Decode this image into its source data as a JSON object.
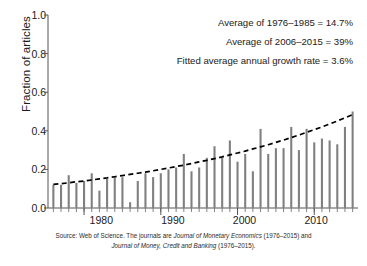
{
  "chart_data": {
    "type": "bar",
    "title": "",
    "xlabel": "",
    "ylabel": "Fraction of articles",
    "ylim": [
      0.0,
      1.0
    ],
    "xlim": [
      1975.3,
      2015.7
    ],
    "yticks": [
      "0.0",
      "0.2",
      "0.4",
      "0.6",
      "0.8",
      "1.0"
    ],
    "ytick_values": [
      0.0,
      0.2,
      0.4,
      0.6,
      0.8,
      1.0
    ],
    "xticks": [
      "1980",
      "1990",
      "2000",
      "2010"
    ],
    "xtick_values": [
      1980,
      1990,
      2000,
      2010
    ],
    "minor_xticks": "every year 1976-2015",
    "grid": false,
    "legend": "none",
    "bar_color": "#808080",
    "trend_color": "#000000",
    "trend_style": "dashed",
    "categories": [
      1976,
      1977,
      1978,
      1979,
      1980,
      1981,
      1982,
      1983,
      1984,
      1985,
      1986,
      1987,
      1988,
      1989,
      1990,
      1991,
      1992,
      1993,
      1994,
      1995,
      1996,
      1997,
      1998,
      1999,
      2000,
      2001,
      2002,
      2003,
      2004,
      2005,
      2006,
      2007,
      2008,
      2009,
      2010,
      2011,
      2012,
      2013,
      2014,
      2015
    ],
    "values": [
      0.12,
      0.12,
      0.17,
      0.13,
      0.14,
      0.18,
      0.09,
      0.15,
      0.16,
      0.16,
      0.03,
      0.14,
      0.18,
      0.16,
      0.18,
      0.2,
      0.21,
      0.28,
      0.19,
      0.21,
      0.26,
      0.32,
      0.26,
      0.35,
      0.24,
      0.28,
      0.19,
      0.41,
      0.28,
      0.31,
      0.31,
      0.42,
      0.3,
      0.41,
      0.34,
      0.36,
      0.35,
      0.33,
      0.42,
      0.5
    ],
    "series": [
      {
        "name": "Fraction of articles",
        "type": "bar",
        "values": [
          0.12,
          0.12,
          0.17,
          0.13,
          0.14,
          0.18,
          0.09,
          0.15,
          0.16,
          0.16,
          0.03,
          0.14,
          0.18,
          0.16,
          0.18,
          0.2,
          0.21,
          0.28,
          0.19,
          0.21,
          0.26,
          0.32,
          0.26,
          0.35,
          0.24,
          0.28,
          0.19,
          0.41,
          0.28,
          0.31,
          0.31,
          0.42,
          0.3,
          0.41,
          0.34,
          0.36,
          0.35,
          0.33,
          0.42,
          0.5
        ]
      },
      {
        "name": "Fitted trend",
        "type": "line",
        "values": [
          0.122,
          0.126,
          0.131,
          0.136,
          0.14,
          0.145,
          0.151,
          0.156,
          0.162,
          0.168,
          0.174,
          0.18,
          0.186,
          0.193,
          0.2,
          0.207,
          0.215,
          0.222,
          0.23,
          0.239,
          0.247,
          0.256,
          0.265,
          0.275,
          0.285,
          0.295,
          0.306,
          0.317,
          0.328,
          0.34,
          0.352,
          0.365,
          0.378,
          0.392,
          0.406,
          0.42,
          0.435,
          0.451,
          0.467,
          0.484
        ]
      }
    ],
    "annotations": [
      "Average of 1976–1985 = 14.7%",
      "Average of 2006–2015 = 39%",
      "Fitted average annual growth rate = 3.6%"
    ]
  },
  "axis": {
    "ylabel": "Fraction of articles",
    "yticks": [
      "1.0",
      "0.8",
      "0.6",
      "0.4",
      "0.2",
      "0.0"
    ],
    "xticks": [
      "1980",
      "1990",
      "2000",
      "2010"
    ]
  },
  "annotations": {
    "line1": "Average of 1976–1985 = 14.7%",
    "line2": "Average of 2006–2015 = 39%",
    "line3": "Fitted average annual growth rate = 3.6%"
  },
  "source": {
    "part1": "Source: Web of Science. The journals are ",
    "italic1": "Journal of Monetary Economics",
    "part2": " (1976–2015) and",
    "italic2": "Journal of Money, Credit and Banking",
    "part3": " (1976–2015)."
  }
}
